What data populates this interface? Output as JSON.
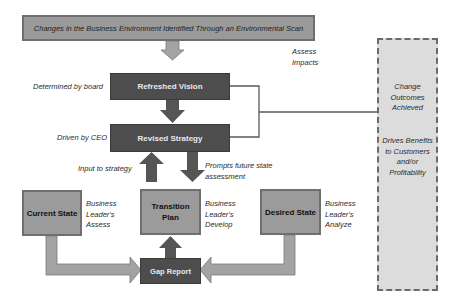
{
  "banner": {
    "text": "Changes in the Business Environment Identified Through an Environmental Scan"
  },
  "annotations": {
    "assess_impacts": [
      "Assess",
      "Impacts"
    ],
    "determined_by_board": "Determined by board",
    "driven_by_ceo": "Driven by CEO",
    "input_to_strategy": "Input to strategy",
    "prompts_future_state": [
      "Prompts future state",
      "assessment"
    ],
    "current_state_note": [
      "Business",
      "Leader's",
      "Assess"
    ],
    "transition_plan_note": [
      "Business",
      "Leader's",
      "Develop"
    ],
    "desired_state_note": [
      "Business",
      "Leader's",
      "Analyze"
    ]
  },
  "boxes": {
    "refreshed_vision": "Refreshed Vision",
    "revised_strategy": "Revised Strategy",
    "current_state": "Current State",
    "transition_plan": [
      "Transition",
      "Plan"
    ],
    "desired_state": "Desired State",
    "gap_report": "Gap Report"
  },
  "outcomes_panel": {
    "top": [
      "Change",
      "Outcomes",
      "Achieved"
    ],
    "bottom": [
      "Drives Benefits",
      "to Customers",
      "and/or",
      "Profitability"
    ]
  },
  "colors": {
    "dark_box": "#4d4d4d",
    "mid_box": "#9b9b9b",
    "light_arrow": "#a3a3a3",
    "dark_arrow": "#555555",
    "panel": "#dcdcdc",
    "connector": "#5a5a5a"
  }
}
